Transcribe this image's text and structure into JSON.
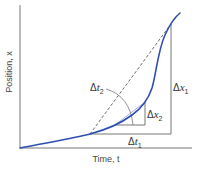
{
  "diagram": {
    "type": "position-time graph with secant and tangent intervals",
    "axes": {
      "x_label": "Time, t",
      "y_label": "Position, x"
    },
    "annotations": {
      "dt1": {
        "delta": "Δ",
        "var": "t",
        "sub": "1"
      },
      "dx1": {
        "delta": "Δ",
        "var": "x",
        "sub": "1"
      },
      "dt2": {
        "delta": "Δ",
        "var": "t",
        "sub": "2"
      },
      "dx2": {
        "delta": "Δ",
        "var": "x",
        "sub": "2"
      }
    },
    "colors": {
      "curve": "#2f4fb0",
      "axes": "#555555",
      "guides": "#666666",
      "dashed": "#444444"
    }
  }
}
